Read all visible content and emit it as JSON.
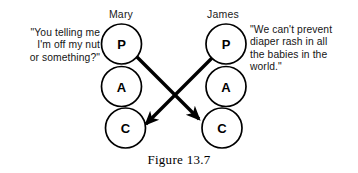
{
  "figure": {
    "caption": "Figure 13.7",
    "type": "transactional-analysis-crossed-transaction"
  },
  "persons": [
    {
      "id": "mary",
      "name": "Mary",
      "quote": "\"You telling me\nI'm off my nut\nor something?\"",
      "ego_states": [
        {
          "code": "P",
          "label": "P"
        },
        {
          "code": "A",
          "label": "A"
        },
        {
          "code": "C",
          "label": "C"
        }
      ]
    },
    {
      "id": "james",
      "name": "James",
      "quote": "\"We can't prevent\ndiaper rash in all\nthe babies in the\nworld.\"",
      "ego_states": [
        {
          "code": "P",
          "label": "P"
        },
        {
          "code": "A",
          "label": "A"
        },
        {
          "code": "C",
          "label": "C"
        }
      ]
    }
  ],
  "transactions": [
    {
      "id": "mary-parent-to-james-child",
      "from": "mary.P",
      "to": "james.C",
      "direction": "down-right",
      "arrowhead": true
    },
    {
      "id": "james-parent-to-mary-child",
      "from": "james.P",
      "to": "mary.C",
      "direction": "down-left",
      "arrowhead": true
    }
  ],
  "colors": {
    "background": "#ffffff",
    "ink": "#000000",
    "text": "#151515"
  }
}
